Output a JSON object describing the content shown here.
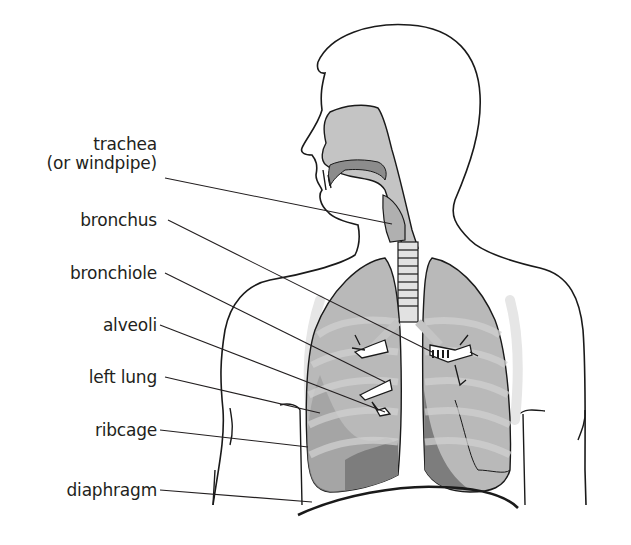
{
  "diagram": {
    "labels": [
      {
        "id": "trachea",
        "line1": "trachea",
        "line2": "(or windpipe)",
        "top": 135,
        "anchor": [
          165,
          178
        ],
        "target": [
          392,
          224
        ]
      },
      {
        "id": "bronchus",
        "line1": "bronchus",
        "top": 211,
        "anchor": [
          168,
          220
        ],
        "target": [
          432,
          328
        ]
      },
      {
        "id": "bronchiole",
        "line1": "bronchiole",
        "top": 264,
        "anchor": [
          165,
          273
        ],
        "target": [
          378,
          378
        ]
      },
      {
        "id": "alveoli",
        "line1": "alveoli",
        "top": 316,
        "anchor": [
          160,
          325
        ],
        "target": [
          383,
          411
        ]
      },
      {
        "id": "left-lung",
        "line1": "left lung",
        "top": 368,
        "anchor": [
          165,
          377
        ],
        "target": [
          318,
          415
        ]
      },
      {
        "id": "ribcage",
        "line1": "ribcage",
        "top": 421,
        "anchor": [
          160,
          430
        ],
        "target": [
          308,
          447
        ]
      },
      {
        "id": "diaphragm",
        "line1": "diaphragm",
        "top": 481,
        "anchor": [
          160,
          490
        ],
        "target": [
          312,
          503
        ]
      }
    ],
    "colors": {
      "outline": "#1a1a1a",
      "lung_light": "#b9b9b9",
      "lung_mid": "#9c9c9c",
      "lung_dark": "#7d7d7d",
      "airway": "#c4c4c4",
      "rib": "#d6d6d6",
      "text": "#231f20"
    }
  }
}
